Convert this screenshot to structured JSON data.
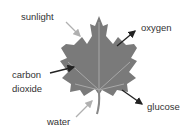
{
  "diagram": {
    "labels": {
      "sunlight": "sunlight",
      "oxygen": "oxygen",
      "carbon": "carbon",
      "dioxide": "dioxide",
      "glucose": "glucose",
      "water": "water"
    },
    "colors": {
      "leaf": "#7a7a7a",
      "vein": "#a8a8a8",
      "arrow_dark": "#222222",
      "arrow_light": "#b0b0b0"
    }
  }
}
